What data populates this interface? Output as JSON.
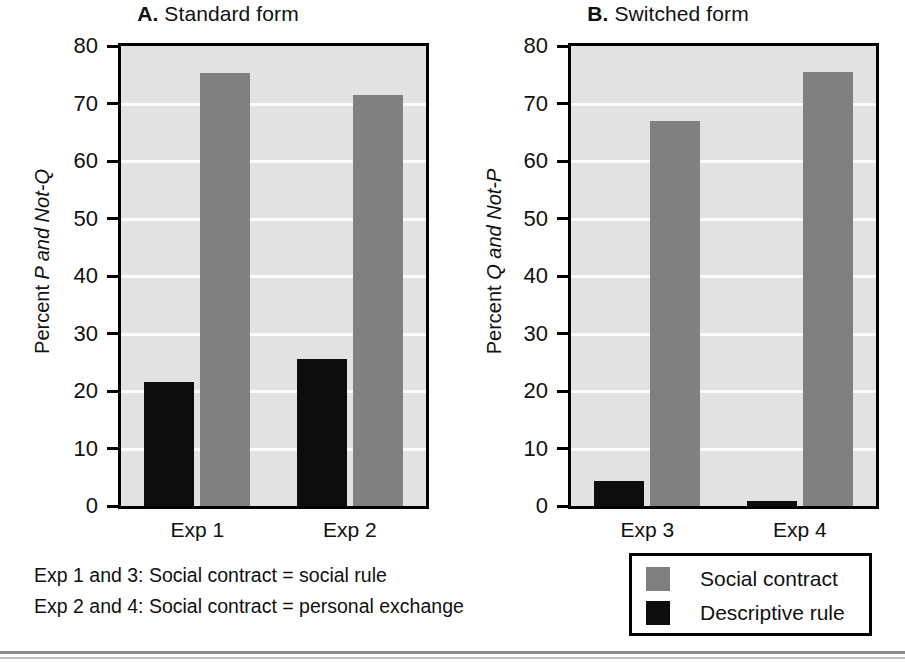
{
  "chart_data": {
    "type": "bar",
    "title": "",
    "panels": [
      {
        "id": "A",
        "letter": "A.",
        "title": " Standard form",
        "ylabel_prefix": "Percent ",
        "ylabel_italic": "P and Not-Q",
        "categories": [
          "Exp 1",
          "Exp 2"
        ],
        "series": [
          {
            "name": "Descriptive rule",
            "values": [
              21.5,
              25.5
            ],
            "color": "#0d0d0d"
          },
          {
            "name": "Social contract",
            "values": [
              75.3,
              71.5
            ],
            "color": "#808080"
          }
        ],
        "ylim": [
          0,
          80
        ],
        "yticks": [
          0,
          10,
          20,
          30,
          40,
          50,
          60,
          70,
          80
        ],
        "grid": true,
        "legend_position": "outside-bottom-right"
      },
      {
        "id": "B",
        "letter": "B.",
        "title": " Switched form",
        "ylabel_prefix": "Percent ",
        "ylabel_italic": "Q and Not-P",
        "categories": [
          "Exp 3",
          "Exp 4"
        ],
        "series": [
          {
            "name": "Descriptive rule",
            "values": [
              4.4,
              0.8
            ],
            "color": "#0d0d0d"
          },
          {
            "name": "Social contract",
            "values": [
              67.0,
              75.5
            ],
            "color": "#808080"
          }
        ],
        "ylim": [
          0,
          80
        ],
        "yticks": [
          0,
          10,
          20,
          30,
          40,
          50,
          60,
          70,
          80
        ],
        "grid": true,
        "legend_position": "outside-bottom-right"
      }
    ],
    "legend": [
      {
        "label": "Social contract",
        "color": "#808080"
      },
      {
        "label": "Descriptive rule",
        "color": "#0d0d0d"
      }
    ],
    "notes": [
      "Exp 1 and 3: Social contract = social rule",
      "Exp 2 and 4: Social contract = personal exchange"
    ]
  },
  "colors": {
    "social_contract": "#808080",
    "descriptive_rule": "#0d0d0d",
    "plot_background": "#e2e2e2",
    "gridline": "#fbfbfb",
    "axis": "#000000"
  }
}
